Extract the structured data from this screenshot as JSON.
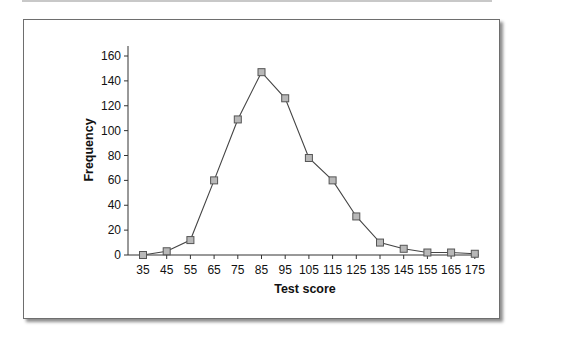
{
  "chart_data": {
    "type": "line",
    "title": "",
    "xlabel": "Test score",
    "ylabel": "Frequency",
    "categories": [
      "35",
      "45",
      "55",
      "65",
      "75",
      "85",
      "95",
      "105",
      "115",
      "125",
      "135",
      "145",
      "155",
      "165",
      "175"
    ],
    "series": [
      {
        "name": "Frequency",
        "values": [
          0,
          3,
          12,
          60,
          109,
          147,
          126,
          78,
          60,
          31,
          10,
          5,
          2,
          2,
          1
        ],
        "marker": "square",
        "marker_fill": "#b8b8b8",
        "marker_stroke": "#555555",
        "line_color": "#444444"
      }
    ],
    "yticks": [
      0,
      20,
      40,
      60,
      80,
      100,
      120,
      140,
      160
    ],
    "ylim": [
      0,
      160
    ],
    "grid": false,
    "legend": null
  }
}
